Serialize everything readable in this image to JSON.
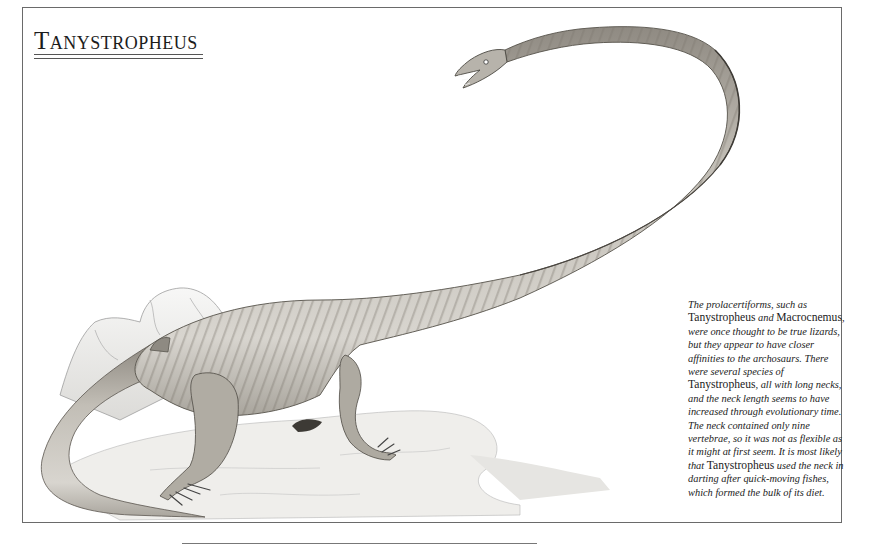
{
  "page": {
    "title": "Tanystropheus",
    "title_first_letter": "T",
    "title_rest": "anystropheus"
  },
  "caption": {
    "segments": [
      {
        "text": "The prolacertiforms, such as ",
        "style": "italic"
      },
      {
        "text": "Tanystropheus",
        "style": "roman"
      },
      {
        "text": " and ",
        "style": "italic"
      },
      {
        "text": "Macrocnemus",
        "style": "roman"
      },
      {
        "text": ", were once thought to be true lizards, but they appear to have closer affinities to the archosaurs. There were several species of ",
        "style": "italic"
      },
      {
        "text": "Tanystropheus",
        "style": "roman"
      },
      {
        "text": ", all with long necks, and the neck length seems to have increased through evolutionary time. The neck contained only nine vertebrae, so it was not as flexible as it might at first seem. It is most likely that ",
        "style": "italic"
      },
      {
        "text": "Tanystropheus",
        "style": "roman"
      },
      {
        "text": " used the neck in darting after quick-moving fishes, which formed the bulk of its diet.",
        "style": "italic"
      }
    ]
  },
  "illustration": {
    "subject": "Tanystropheus reptile with very long neck, standing on rocks",
    "palette": {
      "body_light": "#d9d6cf",
      "body_mid": "#b3afa6",
      "body_dark": "#6f6b64",
      "stripe": "#8c877e",
      "rock": "#ecebe8",
      "rock_line": "#9a9a9a",
      "frame": "#6a6a6a"
    }
  }
}
